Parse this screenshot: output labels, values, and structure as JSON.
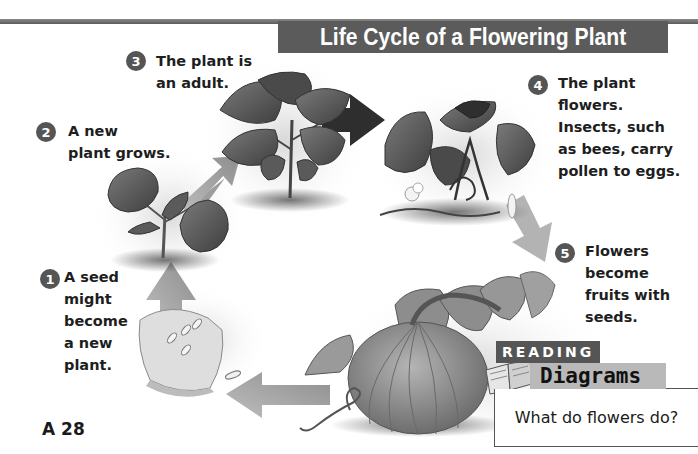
{
  "header": {
    "title": "Life Cycle of a Flowering Plant"
  },
  "steps": [
    {
      "number": "1",
      "lines": [
        "A seed",
        "might",
        "become",
        "a new",
        "plant."
      ]
    },
    {
      "number": "2",
      "lines": [
        "A new",
        "plant grows."
      ]
    },
    {
      "number": "3",
      "lines": [
        "The plant is",
        "an adult."
      ]
    },
    {
      "number": "4",
      "lines": [
        "The plant",
        "flowers.",
        "Insects, such",
        "as bees, carry",
        "pollen to eggs."
      ]
    },
    {
      "number": "5",
      "lines": [
        "Flowers",
        "become",
        "fruits with",
        "seeds."
      ]
    }
  ],
  "illustrations": {
    "stage_1": "pumpkin-slice-with-seeds",
    "stage_2": "seedling",
    "stage_3": "adult-plant",
    "stage_4": "flowering-vine",
    "stage_5": "pumpkin-fruit",
    "arrows": [
      "seed-to-seedling",
      "seedling-to-adult",
      "adult-to-flowering",
      "flowering-to-fruit",
      "fruit-to-seed"
    ]
  },
  "reading_box": {
    "tag": "READING",
    "title": "Diagrams",
    "question": "What do flowers do?"
  },
  "footer": {
    "page_number": "A 28"
  },
  "colors": {
    "title_bar": "#5b5b5b",
    "badge": "#555555",
    "arrow_light": "#9a9a9a",
    "arrow_dark": "#2e2e2e",
    "diagrams_tag": "#b9b9b9"
  }
}
